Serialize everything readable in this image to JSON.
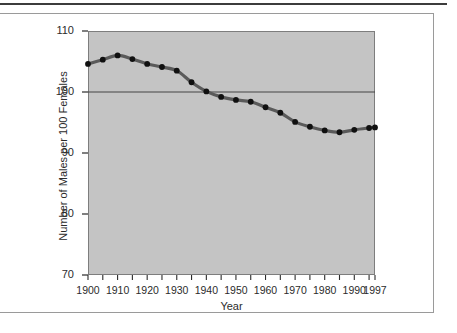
{
  "chart_data": {
    "type": "line",
    "title": "",
    "xlabel": "Year",
    "ylabel": "Number of Males per 100 Females",
    "xlim": [
      1900,
      1997
    ],
    "ylim": [
      70,
      110
    ],
    "yticks": [
      70,
      80,
      90,
      100,
      110
    ],
    "ytick_labels": [
      "70",
      "80",
      "90",
      "100",
      "110"
    ],
    "xticks": [
      1900,
      1910,
      1920,
      1930,
      1940,
      1950,
      1960,
      1970,
      1980,
      1990,
      1997
    ],
    "xtick_labels": [
      "1900",
      "1910",
      "1920",
      "1930",
      "1940",
      "1950",
      "1960",
      "1970",
      "1980",
      "1990",
      "1997"
    ],
    "minor_xtick_interval": 5,
    "grid": false,
    "legend": "none",
    "reference_line": {
      "y": 100,
      "color": "#444444"
    },
    "plot_background": "#c4c4c4",
    "line_color": "#5a5a5a",
    "marker_color": "#101010",
    "x": [
      1900,
      1905,
      1910,
      1915,
      1920,
      1925,
      1930,
      1935,
      1940,
      1945,
      1950,
      1955,
      1960,
      1965,
      1970,
      1975,
      1980,
      1985,
      1990,
      1995,
      1997
    ],
    "values": [
      104.6,
      105.3,
      106.0,
      105.4,
      104.6,
      104.1,
      103.5,
      101.6,
      100.1,
      99.2,
      98.7,
      98.4,
      97.5,
      96.6,
      95.1,
      94.3,
      93.7,
      93.4,
      93.8,
      94.1,
      94.2
    ],
    "series": [
      {
        "name": "Males per 100 Females",
        "values": [
          104.6,
          105.3,
          106.0,
          105.4,
          104.6,
          104.1,
          103.5,
          101.6,
          100.1,
          99.2,
          98.7,
          98.4,
          97.5,
          96.6,
          95.1,
          94.3,
          93.7,
          93.4,
          93.8,
          94.1,
          94.2
        ]
      }
    ]
  }
}
